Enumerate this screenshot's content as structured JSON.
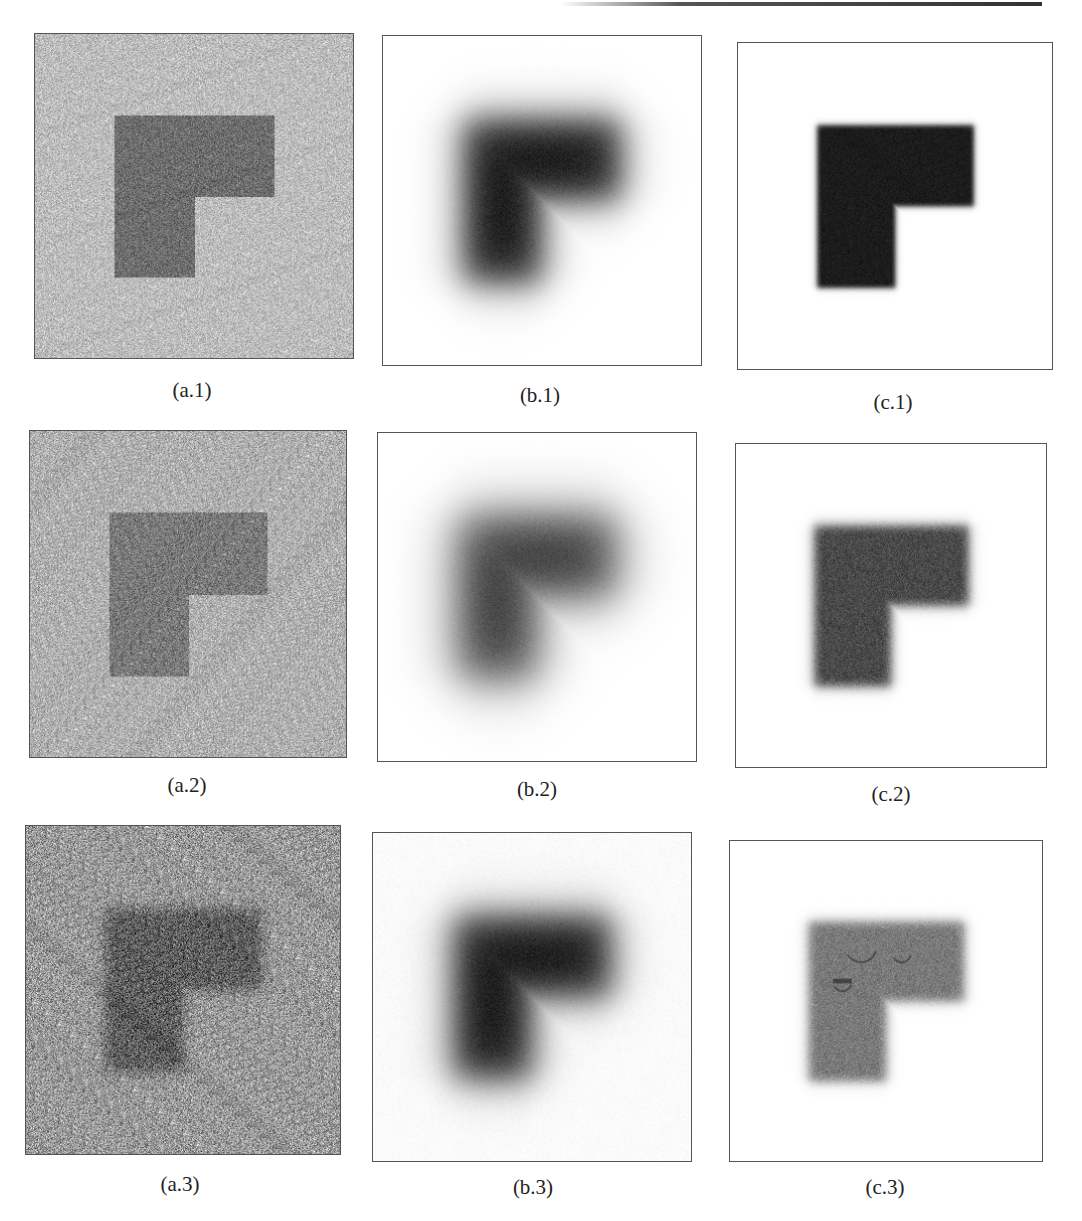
{
  "figure": {
    "panels": [
      {
        "id": "a.1",
        "label": "(a.1)",
        "kind": "noisy",
        "noise_level": "low",
        "background_gray": "#bdbdbd",
        "shape_gray": "#6e6e6e"
      },
      {
        "id": "b.1",
        "label": "(b.1)",
        "kind": "blurred",
        "noise_level": "low",
        "background_gray": "#ffffff",
        "shape_gray": "#1e1e1e"
      },
      {
        "id": "c.1",
        "label": "(c.1)",
        "kind": "restored",
        "noise_level": "low",
        "background_gray": "#ffffff",
        "shape_gray": "#1c1c1c"
      },
      {
        "id": "a.2",
        "label": "(a.2)",
        "kind": "noisy",
        "noise_level": "medium",
        "background_gray": "#b0b0b0",
        "shape_gray": "#7a7a7a"
      },
      {
        "id": "b.2",
        "label": "(b.2)",
        "kind": "blurred",
        "noise_level": "medium",
        "background_gray": "#ffffff",
        "shape_gray": "#3a3a3a"
      },
      {
        "id": "c.2",
        "label": "(c.2)",
        "kind": "restored",
        "noise_level": "medium",
        "background_gray": "#ffffff",
        "shape_gray": "#4a4a4a"
      },
      {
        "id": "a.3",
        "label": "(a.3)",
        "kind": "noisy",
        "noise_level": "high",
        "background_gray": "#9a9a9a",
        "shape_gray": "#5e5e5e"
      },
      {
        "id": "b.3",
        "label": "(b.3)",
        "kind": "blurred",
        "noise_level": "high",
        "background_gray": "#ffffff",
        "shape_gray": "#1e1e1e"
      },
      {
        "id": "c.3",
        "label": "(c.3)",
        "kind": "restored",
        "noise_level": "high",
        "background_gray": "#ffffff",
        "shape_gray": "#7a7a7a"
      }
    ]
  }
}
